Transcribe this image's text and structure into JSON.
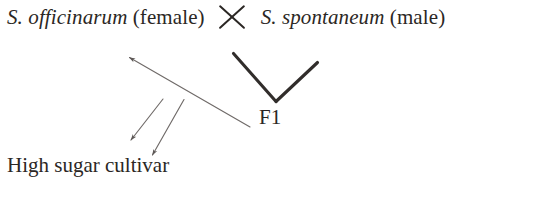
{
  "figure": {
    "background_color": "#ffffff",
    "ink_color": "#2b2724",
    "arrow_color": "#6f6a68",
    "width": 537,
    "height": 221
  },
  "parents": {
    "female_parent_species": "S. officinarum",
    "female_parent_sex": "(female)",
    "cross_symbol": "multiplication-cross",
    "male_parent_species": "S. spontaneum",
    "male_parent_sex": "(male)"
  },
  "progeny": {
    "f1_label": "F1"
  },
  "outcome": {
    "label": "High sugar cultivar"
  },
  "connectors": {
    "v_left_arm": "line from female parent down to F1 vertex",
    "v_right_arm": "line from male parent down to F1 vertex",
    "long_backcross_arrow": "arrow from F1 up-left toward recurrent parent",
    "short_arrow_one": "arrow pointing down-left to high sugar cultivar",
    "short_arrow_two": "arrow pointing down-left to high sugar cultivar"
  }
}
